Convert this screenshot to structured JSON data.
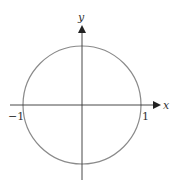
{
  "diagram": {
    "type": "unit-circle",
    "axes": {
      "x_label": "x",
      "y_label": "y"
    },
    "ticks": {
      "neg_one": "−1",
      "pos_one": "1"
    },
    "colors": {
      "axis": "#333333",
      "circle": "#8a8a8a"
    }
  }
}
